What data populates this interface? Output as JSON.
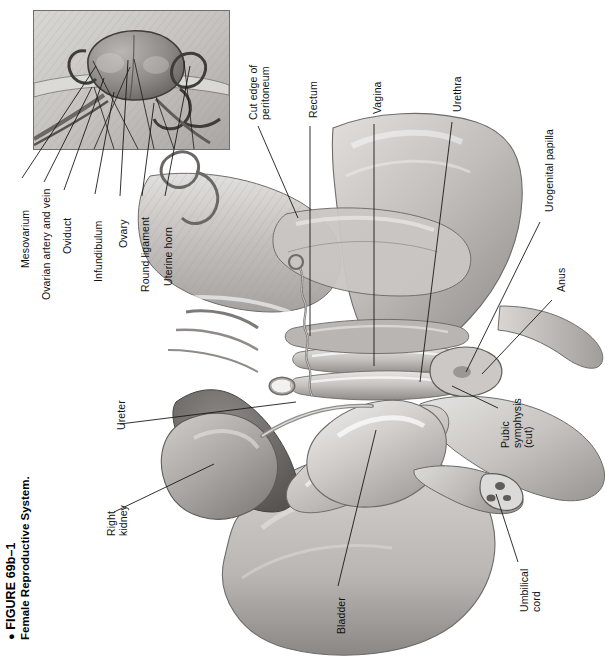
{
  "figure": {
    "bullet": "●",
    "number": "FIGURE 69b–1",
    "title": "Female Reproductive System."
  },
  "inset": {
    "name": "ovary-oviduct-detail-inset",
    "border_color": "#6f6f6f",
    "background": "#cfcfcf"
  },
  "palette": {
    "ink": "#1a1a1a",
    "paper": "#ffffff",
    "tissue_light": "#d8d6d4",
    "tissue_mid": "#b6b3b0",
    "tissue_dark": "#8d8a87",
    "tissue_darkest": "#5e5b58",
    "organ_shadow": "#707070",
    "vessel": "#8a8a8a"
  },
  "labels": [
    {
      "id": "mesovarium",
      "text": "Mesovarium",
      "lines": [
        "Mesovarium"
      ],
      "x": 20,
      "y": 268,
      "lx1": 22,
      "ly1": 178,
      "lx2": 96,
      "ly2": 66
    },
    {
      "id": "ovarian-artery-vein",
      "text": "Ovarian artery and vein",
      "lines": [
        "Ovarian artery and vein"
      ],
      "x": 41,
      "y": 300,
      "lx1": 44,
      "ly1": 182,
      "lx2": 92,
      "ly2": 87
    },
    {
      "id": "oviduct",
      "text": "Oviduct",
      "lines": [
        "Oviduct"
      ],
      "x": 62,
      "y": 254,
      "lx1": 64,
      "ly1": 190,
      "lx2": 104,
      "ly2": 78
    },
    {
      "id": "infundibulum",
      "text": "Infundibulum",
      "lines": [
        "Infundibulum"
      ],
      "x": 93,
      "y": 282,
      "lx1": 95,
      "ly1": 194,
      "lx2": 114,
      "ly2": 92
    },
    {
      "id": "ovary",
      "text": "Ovary",
      "lines": [
        "Ovary"
      ],
      "x": 118,
      "y": 248,
      "lx1": 120,
      "ly1": 196,
      "lx2": 128,
      "ly2": 60
    },
    {
      "id": "round-ligament",
      "text": "Round ligament",
      "lines": [
        "Round ligament"
      ],
      "x": 140,
      "y": 292,
      "lx1": 142,
      "ly1": 196,
      "lx2": 154,
      "ly2": 103
    },
    {
      "id": "uterine-horn",
      "text": "Uterine horn",
      "lines": [
        "Uterine horn"
      ],
      "x": 163,
      "y": 286,
      "lx1": 165,
      "ly1": 196,
      "lx2": 190,
      "ly2": 66
    },
    {
      "id": "cut-edge-peritoneum",
      "text": "Cut edge of peritoneum",
      "lines": [
        "Cut edge of",
        "peritoneum"
      ],
      "x": 248,
      "y": 120,
      "lx1": 258,
      "ly1": 126,
      "lx2": 298,
      "ly2": 218
    },
    {
      "id": "rectum",
      "text": "Rectum",
      "lines": [
        "Rectum"
      ],
      "x": 308,
      "y": 118,
      "lx1": 310,
      "ly1": 126,
      "lx2": 310,
      "ly2": 336
    },
    {
      "id": "vagina",
      "text": "Vagina",
      "lines": [
        "Vagina"
      ],
      "x": 372,
      "y": 114,
      "lx1": 374,
      "ly1": 124,
      "lx2": 374,
      "ly2": 366
    },
    {
      "id": "urethra",
      "text": "Urethra",
      "lines": [
        "Urethra"
      ],
      "x": 452,
      "y": 112,
      "lx1": 452,
      "ly1": 122,
      "lx2": 420,
      "ly2": 382
    },
    {
      "id": "urogenital-papilla",
      "text": "Urogenital papilla",
      "lines": [
        "Urogenital papilla"
      ],
      "x": 544,
      "y": 212,
      "lx1": 540,
      "ly1": 222,
      "lx2": 466,
      "ly2": 372
    },
    {
      "id": "anus",
      "text": "Anus",
      "lines": [
        "Anus"
      ],
      "x": 556,
      "y": 292,
      "lx1": 552,
      "ly1": 300,
      "lx2": 482,
      "ly2": 374
    },
    {
      "id": "pubic-symphysis-cut",
      "text": "Pubic symphysis (cut)",
      "lines": [
        "Pubic",
        "symphysis",
        "(cut)"
      ],
      "x": 500,
      "y": 448,
      "lx1": 498,
      "ly1": 408,
      "lx2": 452,
      "ly2": 386
    },
    {
      "id": "umbilical-cord",
      "text": "Umbilical cord",
      "lines": [
        "Umbilical",
        "cord"
      ],
      "x": 519,
      "y": 612,
      "lx1": 518,
      "ly1": 562,
      "lx2": 496,
      "ly2": 494
    },
    {
      "id": "bladder",
      "text": "Bladder",
      "lines": [
        "Bladder"
      ],
      "x": 336,
      "y": 634,
      "lx1": 338,
      "ly1": 586,
      "lx2": 376,
      "ly2": 430
    },
    {
      "id": "ureter",
      "text": "Ureter",
      "lines": [
        "Ureter"
      ],
      "x": 116,
      "y": 430,
      "lx1": 120,
      "ly1": 424,
      "lx2": 296,
      "ly2": 402
    },
    {
      "id": "right-kidney",
      "text": "Right kidney",
      "lines": [
        "Right",
        "kidney"
      ],
      "x": 106,
      "y": 536,
      "lx1": 114,
      "ly1": 512,
      "lx2": 214,
      "ly2": 464
    }
  ]
}
